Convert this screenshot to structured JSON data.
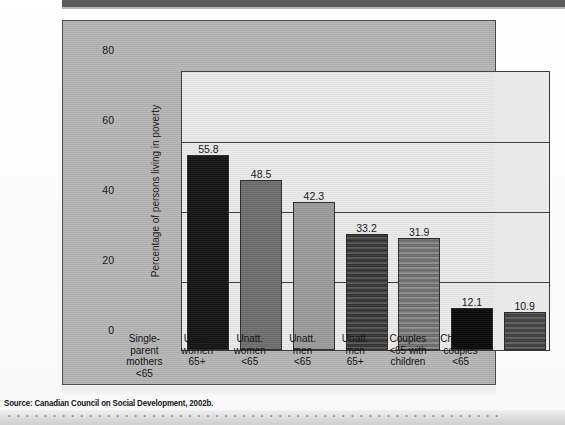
{
  "figure": {
    "source_caption": "Source: Canadian Council on Social Development, 2002b.",
    "panel_color": "#b4b4b4",
    "plot_background": "#e9e9e9"
  },
  "page": {
    "bleed_through_text": "• • • • • • • • • • • • • • • • • • • • • • • • • • • • • • • • • • • • • • • • • • • • • • • • • • • • • • •"
  },
  "chart_data": {
    "type": "bar",
    "title": "",
    "xlabel": "",
    "ylabel": "Percentage of persons living in poverty",
    "ylim": [
      0,
      80
    ],
    "yticks": [
      0,
      20,
      40,
      60,
      80
    ],
    "grid": true,
    "legend": "none",
    "categories": [
      "Single-\nparent\nmothers\n<65",
      "Unatt.\nwomen\n65+",
      "Unatt.\nwomen\n<65",
      "Unatt.\nmen\n<65",
      "Unatt.\nmen\n65+",
      "Couples\n<65 with\nchildren",
      "Childless\ncouples\n<65"
    ],
    "category_lines": [
      [
        "Single-",
        "parent",
        "mothers",
        "<65"
      ],
      [
        "Unatt.",
        "women",
        "65+"
      ],
      [
        "Unatt.",
        "women",
        "<65"
      ],
      [
        "Unatt.",
        "men",
        "<65"
      ],
      [
        "Unatt.",
        "men",
        "65+"
      ],
      [
        "Couples",
        "<65 with",
        "children"
      ],
      [
        "Childless",
        "couples",
        "<65"
      ]
    ],
    "values": [
      55.8,
      48.5,
      42.3,
      33.2,
      31.9,
      12.1,
      10.9
    ],
    "value_labels": [
      "55.8",
      "48.5",
      "42.3",
      "33.2",
      "31.9",
      "12.1",
      "10.9"
    ],
    "bar_colors": [
      "#141414",
      "#6e6e6e",
      "#9a9a9a",
      "#3a3a3a",
      "#7a7a7a",
      "#0a0a0a",
      "#4a4a4a"
    ],
    "bar_textured": [
      false,
      false,
      false,
      true,
      true,
      false,
      true
    ]
  }
}
